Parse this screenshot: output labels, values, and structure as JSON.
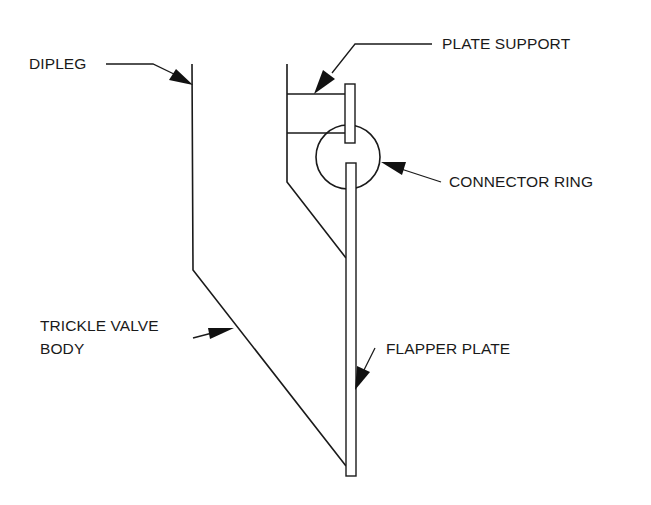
{
  "diagram": {
    "colors": {
      "stroke": "#1a1a1a",
      "background": "#ffffff"
    },
    "labels": {
      "dipleg": "DIPLEG",
      "plate_support": "PLATE SUPPORT",
      "connector_ring": "CONNECTOR RING",
      "trickle_valve_body_line1": "TRICKLE VALVE",
      "trickle_valve_body_line2": "BODY",
      "flapper_plate": "FLAPPER PLATE"
    },
    "components": [
      {
        "id": "dipleg",
        "label": "DIPLEG"
      },
      {
        "id": "plate-support",
        "label": "PLATE SUPPORT"
      },
      {
        "id": "connector-ring",
        "label": "CONNECTOR RING"
      },
      {
        "id": "trickle-valve-body",
        "label": "TRICKLE VALVE BODY"
      },
      {
        "id": "flapper-plate",
        "label": "FLAPPER PLATE"
      }
    ]
  }
}
